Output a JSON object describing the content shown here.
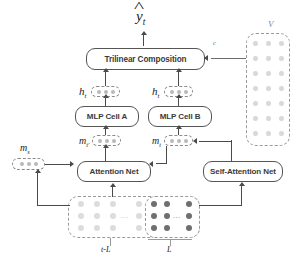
{
  "figure": {
    "output": {
      "symbol": "y",
      "subscript": "t",
      "accent": "hat"
    },
    "modules": [
      {
        "id": "trilinear",
        "label": "Trilinear Composition"
      },
      {
        "id": "mlp_a",
        "label": "MLP Cell A"
      },
      {
        "id": "mlp_b",
        "label": "MLP Cell B"
      },
      {
        "id": "attention",
        "label": "Attention Net"
      },
      {
        "id": "self_attention",
        "label": "Self-Attention Net"
      }
    ],
    "vectors": [
      {
        "id": "h_a",
        "symbol": "h",
        "subscript": "t",
        "dots": 3
      },
      {
        "id": "h_b",
        "symbol": "h",
        "subscript": "t",
        "dots": 3
      },
      {
        "id": "m_a",
        "symbol": "m",
        "subscript": "t'",
        "dots": 3
      },
      {
        "id": "m_b",
        "symbol": "m",
        "subscript": "t",
        "dots": 3
      },
      {
        "id": "m_attn_left",
        "symbol": "m",
        "subscript": "t'",
        "dots": 3
      },
      {
        "id": "m_attn_right",
        "symbol": "m",
        "subscript": "t",
        "dots": 3
      },
      {
        "id": "m_far_left",
        "symbol": "m",
        "subscript": "s",
        "dots": 3
      }
    ],
    "memory_panel": {
      "label": "V",
      "rows": 7,
      "cols": 3
    },
    "trilinear_side_label": "c",
    "sequence": {
      "rows": 3,
      "history_cols": 4,
      "recent_cols": 3,
      "history_label": "t-L",
      "recent_label": "L",
      "ellipsis": "..."
    },
    "colors": {
      "stroke": "#4a4a4a",
      "dashed": "#8a8a8a",
      "dot_pale": "#dcdcdc",
      "dot_dark": "#6f6f6f",
      "text": "#3a3a3a",
      "background": "#ffffff"
    }
  }
}
